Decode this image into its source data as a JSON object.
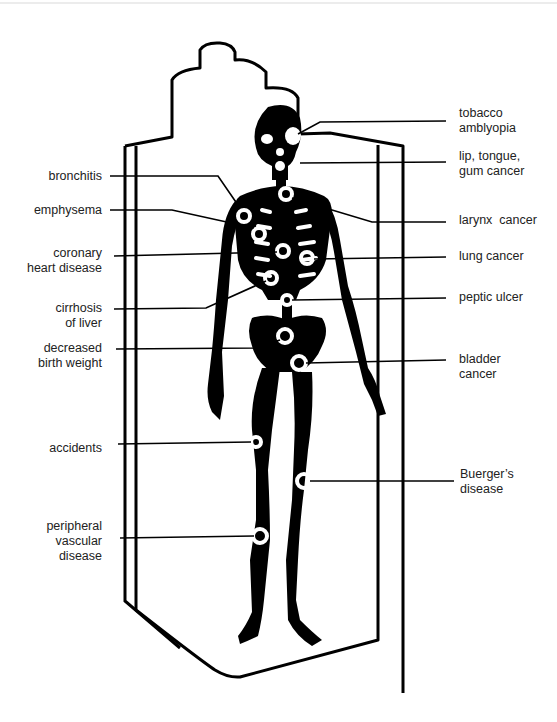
{
  "diagram": {
    "colors": {
      "ink": "#000000",
      "background": "#ffffff",
      "text": "#222222"
    },
    "left_labels": [
      {
        "id": "bronchitis",
        "lines": [
          "bronchitis"
        ]
      },
      {
        "id": "emphysema",
        "lines": [
          "emphysema"
        ]
      },
      {
        "id": "coronary-heart-disease",
        "lines": [
          "coronary",
          "heart disease"
        ]
      },
      {
        "id": "cirrhosis-of-liver",
        "lines": [
          "cirrhosis",
          "of liver"
        ]
      },
      {
        "id": "decreased-birth-weight",
        "lines": [
          "decreased",
          "birth weight"
        ]
      },
      {
        "id": "accidents",
        "lines": [
          "accidents"
        ]
      },
      {
        "id": "peripheral-vascular-disease",
        "lines": [
          "peripheral",
          "vascular",
          "disease"
        ]
      }
    ],
    "right_labels": [
      {
        "id": "tobacco-amblyopia",
        "lines": [
          "tobacco",
          "amblyopia"
        ]
      },
      {
        "id": "lip-tongue-gum-cancer",
        "lines": [
          "lip, tongue,",
          "gum cancer"
        ]
      },
      {
        "id": "larynx-cancer",
        "lines": [
          "larynx  cancer"
        ]
      },
      {
        "id": "lung-cancer",
        "lines": [
          "lung cancer"
        ]
      },
      {
        "id": "peptic-ulcer",
        "lines": [
          "peptic ulcer"
        ]
      },
      {
        "id": "bladder-cancer",
        "lines": [
          "bladder",
          "cancer"
        ]
      },
      {
        "id": "buergers-disease",
        "lines": [
          "Buerger’s",
          "disease"
        ]
      }
    ]
  }
}
